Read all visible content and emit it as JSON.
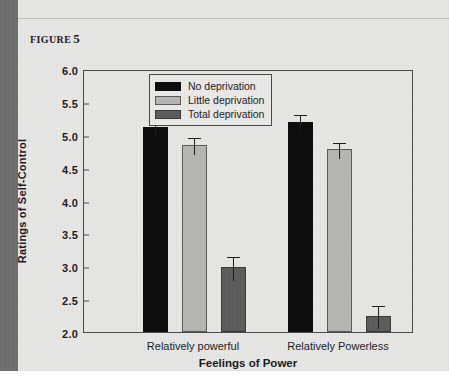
{
  "figure": {
    "caption_prefix": "FIGURE",
    "caption_number": "5"
  },
  "colors": {
    "no_deprivation": "#0d0d0d",
    "little_deprivation": "#b6b6b4",
    "total_deprivation": "#5d5d5d",
    "page_background": "#e6e6e4",
    "axis": "#4a4a4a",
    "left_rule": "#6f6f6f"
  },
  "chart_data": {
    "type": "bar",
    "title": "",
    "xlabel": "Feelings of Power",
    "ylabel": "Ratings of Self-Control",
    "categories": [
      "Relatively powerful",
      "Relatively Powerless"
    ],
    "yticks": [
      "2.0",
      "2.5",
      "3.0",
      "3.5",
      "4.0",
      "4.5",
      "5.0",
      "5.5",
      "6.0"
    ],
    "ytick_values": [
      2.0,
      2.5,
      3.0,
      3.5,
      4.0,
      4.5,
      5.0,
      5.5,
      6.0
    ],
    "ylim": [
      2.0,
      6.0
    ],
    "grid": false,
    "legend_position": "top-center",
    "series": [
      {
        "name": "No deprivation",
        "color": "#0d0d0d",
        "values": [
          5.12,
          5.2
        ],
        "errors": [
          0.12,
          0.13
        ]
      },
      {
        "name": "Little deprivation",
        "color": "#b6b6b4",
        "values": [
          4.85,
          4.78
        ],
        "errors": [
          0.13,
          0.12
        ]
      },
      {
        "name": "Total deprivation",
        "color": "#5d5d5d",
        "values": [
          2.99,
          2.25
        ],
        "errors": [
          0.18,
          0.17
        ]
      }
    ]
  }
}
